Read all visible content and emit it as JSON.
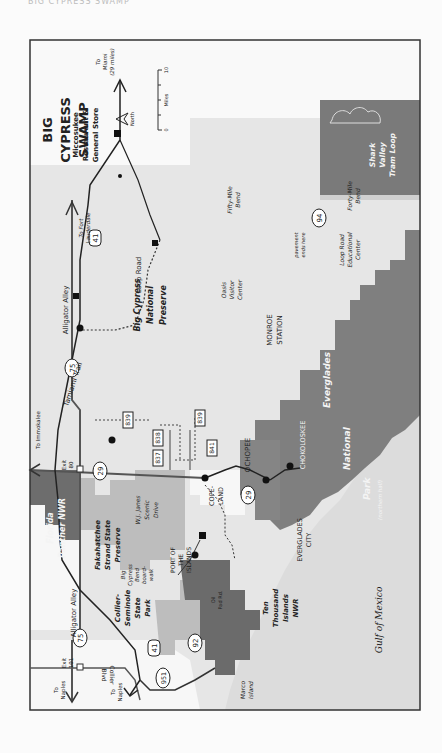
{
  "page_header": "BIG CYPRESS SWAMP",
  "map": {
    "title_lines": [
      "BIG",
      "CYPRESS",
      "SWAMP"
    ],
    "compass": {
      "label": "North"
    },
    "scale": {
      "unit": "Miles",
      "min": "0",
      "max": "10"
    },
    "colors": {
      "background": "#e6e6e6",
      "frame": "#333333",
      "preserve": "#d9d9d9",
      "state_park": "#bdbdbd",
      "national_park": "#7f7f7f",
      "wildlife_refuge": "#6b6b6b",
      "gulf": "#dcdcdc",
      "white_land": "#f7f7f7"
    },
    "areas": {
      "big_cypress": [
        "Big Cypress",
        "National",
        "Preserve"
      ],
      "panther": [
        "Florida",
        "Panther NWR"
      ],
      "fakahatchee": [
        "Fakahatchee",
        "Strand State",
        "Preserve"
      ],
      "collier": [
        "Collier-",
        "Seminole",
        "State",
        "Park"
      ],
      "ten_thousand": [
        "Ten",
        "Thousand",
        "Islands",
        "NWR"
      ],
      "everglades": [
        "Everglades",
        "National",
        "Park",
        "(northern half)"
      ],
      "shark_valley": [
        "Shark",
        "Valley",
        "Tram Loop"
      ],
      "gulf": "Gulf of Mexico"
    },
    "roads": {
      "alligator_alley_1": "Alligator Alley",
      "alligator_alley_2": "Alligator Alley",
      "tamiami": "Tamiami Trail",
      "loop_road": "Loop Road",
      "wj_janes": [
        "W.J. Janes",
        "Scenic",
        "Drive"
      ],
      "collier_blvd": [
        "Collier",
        "Blvd"
      ],
      "oil_pad": [
        "Oil",
        "Pad Rd."
      ],
      "boardwalk": [
        "Big",
        "Cypress",
        "Bend",
        "board-",
        "walk"
      ]
    },
    "shields": {
      "i75_a": "75",
      "i75_b": "75",
      "us41_a": "41",
      "us41_b": "41",
      "sr29_a": "29",
      "sr29_b": "29",
      "sr92": "92",
      "sr951": "951",
      "sr94": "94",
      "cr837": "837",
      "cr838": "838",
      "cr839_a": "839",
      "cr839_b": "839",
      "cr841": "841"
    },
    "exits": {
      "exit80": [
        "Exit",
        "80"
      ],
      "exit101": [
        "Exit",
        "101"
      ]
    },
    "destinations": {
      "fort_lauderdale": [
        "To Fort",
        "Lauderdale"
      ],
      "miami": [
        "To",
        "Miami",
        "(29 miles)"
      ],
      "immokalee": "To Immokalee",
      "naples_a": [
        "To",
        "Naples"
      ],
      "naples_b": [
        "To",
        "Naples"
      ]
    },
    "places": {
      "miccosukee": [
        "Miccosukee",
        "Restaurant &",
        "General Store"
      ],
      "forty_mile": [
        "Forty-Mile",
        "Bend"
      ],
      "fifty_mile": [
        "Fifty-Mile",
        "Bend"
      ],
      "oasis": [
        "Oasis",
        "Visitor",
        "Center"
      ],
      "loop_center": [
        "Loop Road",
        "Educational",
        "Center"
      ],
      "pavement": [
        "pavement",
        "ends here"
      ],
      "monroe": [
        "MONROE",
        "STATION"
      ],
      "ochopee": "OCHOPEE",
      "chokoloskee": "CHOKOLOSKEE",
      "everglades_city": [
        "EVERGLADES",
        "CITY"
      ],
      "copeland": [
        "COPE-",
        "LAND"
      ],
      "port_islands": [
        "PORT OF",
        "THE",
        "ISLANDS"
      ],
      "marco": [
        "Marco",
        "Island"
      ]
    }
  }
}
